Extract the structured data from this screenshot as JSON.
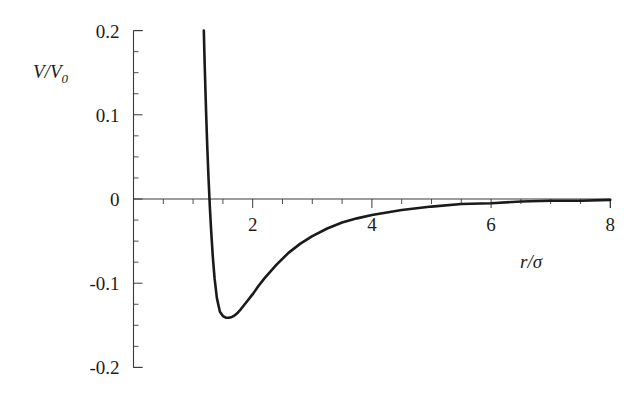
{
  "chart_data": {
    "type": "line",
    "title": "",
    "subtitle": "",
    "xlabel": "r/σ",
    "ylabel": "V/V₀",
    "ylabel_base": "V/V",
    "ylabel_sub": "0",
    "xlabel_numerator": "r",
    "xlabel_slash": "/",
    "xlabel_denominator": "σ",
    "xlim": [
      0,
      8
    ],
    "ylim": [
      -0.2,
      0.2
    ],
    "xticks": [
      2,
      4,
      6,
      8
    ],
    "xtick_labels": [
      "2",
      "4",
      "6",
      "8"
    ],
    "xtick_minor_step": 0.5,
    "yticks": [
      0.2,
      0.1,
      0,
      -0.1,
      -0.2
    ],
    "ytick_labels": [
      "0.2",
      "0.1",
      "0",
      "-0.1",
      "-0.2"
    ],
    "ytick_minor_step": 0.025,
    "grid": false,
    "legend": null,
    "curve_color": "#1a1a1a",
    "axis_color": "#3a3a3a",
    "background_color": "#ffffff",
    "series": [
      {
        "name": "Lennard-Jones potential",
        "zero_crossing_x": 1.28,
        "minimum_x": 1.68,
        "minimum_y": -0.141,
        "top_clip_x": 1.18,
        "top_clip_y": 0.2,
        "x": [
          1.18,
          1.19,
          1.2,
          1.21,
          1.22,
          1.23,
          1.24,
          1.25,
          1.26,
          1.28,
          1.3,
          1.33,
          1.36,
          1.4,
          1.45,
          1.5,
          1.55,
          1.6,
          1.65,
          1.68,
          1.7,
          1.75,
          1.8,
          1.9,
          2.0,
          2.1,
          2.2,
          2.4,
          2.6,
          2.8,
          3.0,
          3.25,
          3.5,
          3.75,
          4.0,
          4.25,
          4.5,
          5.0,
          5.5,
          6.0,
          6.5,
          7.0,
          7.5,
          8.0
        ],
        "y": [
          0.2,
          0.172,
          0.146,
          0.122,
          0.099,
          0.078,
          0.058,
          0.04,
          0.023,
          -0.008,
          -0.034,
          -0.068,
          -0.094,
          -0.118,
          -0.134,
          -0.139,
          -0.141,
          -0.141,
          -0.14,
          -0.139,
          -0.138,
          -0.135,
          -0.131,
          -0.122,
          -0.113,
          -0.103,
          -0.094,
          -0.078,
          -0.064,
          -0.053,
          -0.044,
          -0.035,
          -0.028,
          -0.023,
          -0.019,
          -0.016,
          -0.013,
          -0.009,
          -0.006,
          -0.005,
          -0.003,
          -0.002,
          -0.002,
          -0.001
        ]
      }
    ]
  },
  "figure": {
    "name": "lennard-jones-potential-plot"
  }
}
